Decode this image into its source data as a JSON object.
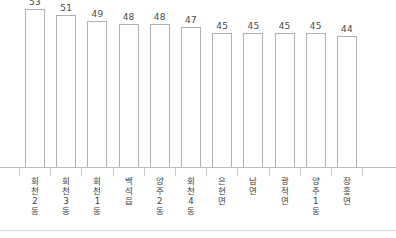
{
  "chart_data": {
    "type": "bar",
    "title": "",
    "subtitle": "",
    "xlabel": "",
    "ylabel": "",
    "ylim": [
      0,
      56
    ],
    "grid": false,
    "legend": "none",
    "bar_style": {
      "fill": "#ffffff",
      "border": "#b0b0b0",
      "value_label_color": "#4a4a4a"
    },
    "axis_color": "#bdbdbd",
    "categories": [
      "회천2동",
      "회천3동",
      "회천1동",
      "백석읍",
      "양주2동",
      "회천4동",
      "은현면",
      "남면",
      "광적면",
      "양주1동",
      "장흥면"
    ],
    "category_labels_vertical": [
      "회\n천\n2\n동",
      "회\n천\n3\n동",
      "회\n천\n1\n동",
      "백\n석\n읍",
      "양\n주\n2\n동",
      "회\n천\n4\n동",
      "은\n현\n면",
      "남\n면",
      "광\n적\n면",
      "양\n주\n1\n동",
      "장\n흥\n면"
    ],
    "values": [
      53,
      51,
      49,
      48,
      48,
      47,
      45,
      45,
      45,
      45,
      44
    ],
    "value_labels": [
      "53",
      "51",
      "49",
      "48",
      "48",
      "47",
      "45",
      "45",
      "45",
      "45",
      "44"
    ]
  }
}
